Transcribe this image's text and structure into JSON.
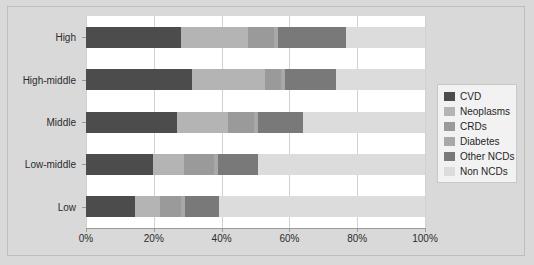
{
  "chart_data": {
    "type": "bar",
    "orientation": "horizontal",
    "stacked": true,
    "normalized": true,
    "title": "",
    "subtitle": "",
    "xlabel": "",
    "ylabel": "",
    "xlim": [
      0,
      100
    ],
    "xticks": [
      0,
      20,
      40,
      60,
      80,
      100
    ],
    "xticklabels": [
      "0%",
      "20%",
      "40%",
      "60%",
      "80%",
      "100%"
    ],
    "grid": true,
    "grid_axis": "x",
    "legend_position": "right-outside",
    "categories": [
      "High",
      "High-middle",
      "Middle",
      "Low-middle",
      "Low"
    ],
    "series": [
      {
        "name": "CVD",
        "color": "#4c4c4c",
        "values": [
          28.0,
          31.3,
          26.8,
          19.7,
          14.5
        ]
      },
      {
        "name": "Neoplasms",
        "color": "#b4b4b4",
        "values": [
          19.8,
          21.5,
          15.0,
          9.3,
          7.3
        ]
      },
      {
        "name": "CRDs",
        "color": "#9a9a9a",
        "values": [
          7.7,
          4.7,
          7.7,
          8.8,
          6.2
        ]
      },
      {
        "name": "Diabetes",
        "color": "#a8a8a8",
        "values": [
          1.2,
          1.2,
          1.2,
          1.2,
          1.2
        ]
      },
      {
        "name": "Other NCDs",
        "color": "#797979",
        "values": [
          20.0,
          15.0,
          13.3,
          11.6,
          10.0
        ]
      },
      {
        "name": "Non NCDs",
        "color": "#dcdcdc",
        "values": [
          23.3,
          26.3,
          36.0,
          49.4,
          60.8
        ]
      }
    ]
  },
  "legend": {
    "items": [
      {
        "label": "CVD",
        "color": "#4c4c4c"
      },
      {
        "label": "Neoplasms",
        "color": "#b4b4b4"
      },
      {
        "label": "CRDs",
        "color": "#9a9a9a"
      },
      {
        "label": "Diabetes",
        "color": "#a8a8a8"
      },
      {
        "label": "Other NCDs",
        "color": "#797979"
      },
      {
        "label": "Non NCDs",
        "color": "#dcdcdc"
      }
    ]
  },
  "axes": {
    "x_tick_labels": [
      "0%",
      "20%",
      "40%",
      "60%",
      "80%",
      "100%"
    ],
    "y_tick_labels": [
      "High",
      "High-middle",
      "Middle",
      "Low-middle",
      "Low"
    ]
  },
  "colors": {
    "figure_background": "#d9d9d9",
    "plot_background": "#ffffff",
    "axis_line": "#9a9a9a",
    "grid": "#d2d2d2",
    "text": "#2b2b2b",
    "legend_background": "#f2f2f2",
    "legend_border": "#c8c8c8"
  }
}
